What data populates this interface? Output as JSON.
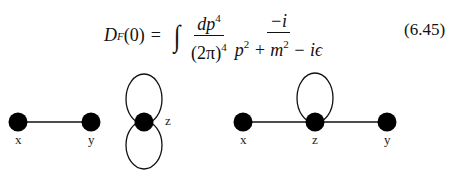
{
  "equation": {
    "lhs": {
      "symbol": "D",
      "subscript": "F",
      "argument": "(0)"
    },
    "equals": "=",
    "integral": "∫",
    "fraction1": {
      "numerator": "dp",
      "numerator_sup": "4",
      "denominator": "(2π)",
      "denominator_sup": "4"
    },
    "fraction2": {
      "numerator": "−i",
      "denominator_parts": [
        "p",
        "2",
        " + m",
        "2",
        " − iϵ"
      ]
    },
    "number": "(6.45)"
  },
  "diagrams": [
    {
      "name": "disconnected-propagator-and-figure-eight",
      "nodes": [
        {
          "label": "x",
          "cx": 18,
          "cy": 122
        },
        {
          "label": "y",
          "cx": 91,
          "cy": 122
        },
        {
          "label": "z",
          "cx": 144,
          "cy": 122
        }
      ],
      "edges": [
        [
          "x",
          "y"
        ]
      ],
      "loops": [
        {
          "at": "z",
          "direction": "up"
        },
        {
          "at": "z",
          "direction": "down"
        }
      ]
    },
    {
      "name": "tadpole-correction",
      "nodes": [
        {
          "label": "x",
          "cx": 243,
          "cy": 122
        },
        {
          "label": "z",
          "cx": 315,
          "cy": 122
        },
        {
          "label": "y",
          "cx": 387,
          "cy": 122
        }
      ],
      "edges": [
        [
          "x",
          "z"
        ],
        [
          "z",
          "y"
        ]
      ],
      "loops": [
        {
          "at": "z",
          "direction": "up"
        }
      ]
    }
  ],
  "colors": {
    "ink": "#111111",
    "background": "#ffffff"
  }
}
